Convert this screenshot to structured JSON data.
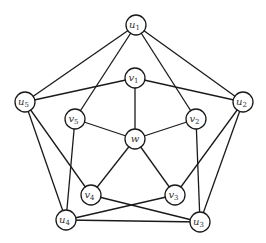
{
  "diagram": {
    "type": "graph",
    "node_radius": 10,
    "stroke_color": "#1a1a1a",
    "fill_color": "#ffffff",
    "label_color": "#333333",
    "nodes": [
      {
        "id": "u1",
        "base": "u",
        "sub": "1",
        "x": 136,
        "y": 25
      },
      {
        "id": "u2",
        "base": "u",
        "sub": "2",
        "x": 243,
        "y": 102
      },
      {
        "id": "u3",
        "base": "u",
        "sub": "3",
        "x": 200,
        "y": 222
      },
      {
        "id": "u4",
        "base": "u",
        "sub": "4",
        "x": 66,
        "y": 220
      },
      {
        "id": "u5",
        "base": "u",
        "sub": "5",
        "x": 25,
        "y": 102
      },
      {
        "id": "v1",
        "base": "v",
        "sub": "1",
        "x": 135,
        "y": 78
      },
      {
        "id": "v2",
        "base": "v",
        "sub": "2",
        "x": 196,
        "y": 119
      },
      {
        "id": "v3",
        "base": "v",
        "sub": "3",
        "x": 175,
        "y": 195
      },
      {
        "id": "v4",
        "base": "v",
        "sub": "4",
        "x": 91,
        "y": 195
      },
      {
        "id": "v5",
        "base": "v",
        "sub": "5",
        "x": 75,
        "y": 119
      },
      {
        "id": "w",
        "base": "w",
        "sub": "",
        "x": 135,
        "y": 139
      }
    ],
    "edges": [
      [
        "u1",
        "u2"
      ],
      [
        "u2",
        "u3"
      ],
      [
        "u3",
        "u4"
      ],
      [
        "u4",
        "u5"
      ],
      [
        "u5",
        "u1"
      ],
      [
        "u1",
        "v5"
      ],
      [
        "u1",
        "v2"
      ],
      [
        "u2",
        "v1"
      ],
      [
        "u2",
        "v3"
      ],
      [
        "u3",
        "v2"
      ],
      [
        "u3",
        "v4"
      ],
      [
        "u4",
        "v3"
      ],
      [
        "u4",
        "v5"
      ],
      [
        "u5",
        "v4"
      ],
      [
        "u5",
        "v1"
      ],
      [
        "w",
        "v1"
      ],
      [
        "w",
        "v2"
      ],
      [
        "w",
        "v3"
      ],
      [
        "w",
        "v4"
      ],
      [
        "w",
        "v5"
      ]
    ]
  }
}
